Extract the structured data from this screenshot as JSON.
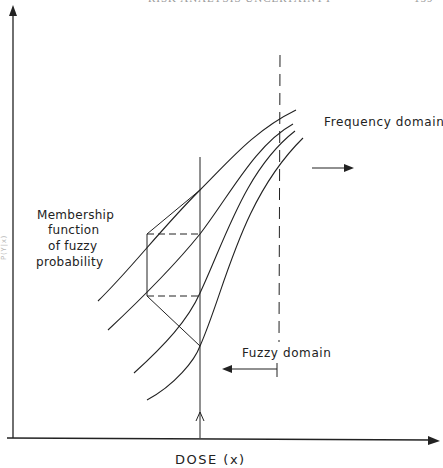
{
  "running_head": {
    "title": "RISK ANALYSIS UNCERTAINTY",
    "page_number": "159"
  },
  "figure": {
    "x_axis_label": "DOSE (x)",
    "y_axis_label_fragment": "P(Y|x)",
    "annotations": {
      "frequency_domain": "Frequency domain",
      "fuzzy_domain": "Fuzzy domain",
      "membership_line1": "Membership",
      "membership_line2": "function",
      "membership_line3": "of fuzzy",
      "membership_line4": "probability"
    },
    "curves": [
      {
        "name": "curve-1",
        "start": [
          98,
          301
        ],
        "end": [
          296,
          110
        ]
      },
      {
        "name": "curve-2",
        "start": [
          108,
          330
        ],
        "end": [
          293,
          124
        ]
      },
      {
        "name": "curve-3",
        "start": [
          134,
          373
        ],
        "end": [
          295,
          131
        ]
      },
      {
        "name": "curve-4",
        "start": [
          147,
          400
        ],
        "end": [
          303,
          138
        ]
      }
    ],
    "dose_line_x": 200,
    "dashed_line_x": 280,
    "intersections_at_dose": [
      190,
      234,
      293,
      346
    ],
    "colors": {
      "ink": "#222222",
      "background": "#ffffff"
    }
  }
}
